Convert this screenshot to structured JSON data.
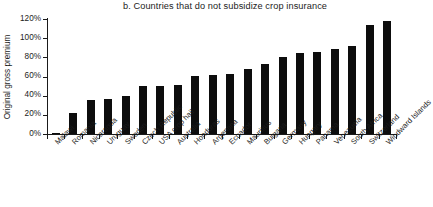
{
  "chart_data": {
    "type": "bar",
    "title": "b. Countries that do not subsidize crop insurance",
    "xlabel": "",
    "ylabel": "Original gross premium",
    "ylim": [
      0,
      120
    ],
    "ytick_labels": [
      "0%",
      "20%",
      "40%",
      "60%",
      "80%",
      "100%",
      "120%"
    ],
    "ytick_values": [
      0,
      20,
      40,
      60,
      80,
      100,
      120
    ],
    "grid": false,
    "legend": "none",
    "bar_color": "#0d0d0d",
    "categories": [
      "Malawi",
      "Romania",
      "Nicaragua",
      "Uruguay",
      "Sweden",
      "Czech Republic",
      "USA crop hail",
      "Australia",
      "Honduras",
      "Argentina",
      "Ecuador",
      "Mauritius",
      "Bulgaria",
      "Germany",
      "Hungary",
      "Panama",
      "Venezuela",
      "South Africa",
      "Switzerland",
      "Windward Islands"
    ],
    "values": [
      1,
      22,
      36,
      37,
      40,
      50,
      50,
      51,
      61,
      62,
      63,
      68,
      73,
      80,
      85,
      86,
      89,
      92,
      114,
      118
    ]
  }
}
